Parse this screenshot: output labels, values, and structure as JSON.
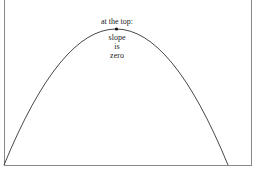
{
  "diagram": {
    "type": "parabola",
    "annotation_top": "at the top:",
    "annotation_lines": [
      "slope",
      "is",
      "zero"
    ],
    "peak_point": {
      "x": 117,
      "y": 29
    },
    "line_color": "#333333",
    "frame_color": "#777777"
  }
}
